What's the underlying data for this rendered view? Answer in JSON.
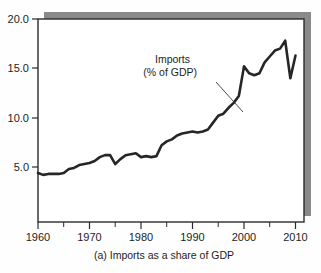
{
  "figure": {
    "caption": "(a) Imports as a share of GDP",
    "background_color": "#fefefe",
    "plot_background_color": "#ffffff",
    "frame_color": "#2b2b2b",
    "shadow_color": "#8a8a8a",
    "series_color": "#262626"
  },
  "annotation": {
    "line1": "Imports",
    "line2": "(% of GDP)",
    "leader_from_x": 216,
    "leader_from_y": 82,
    "leader_to_x": 243,
    "leader_to_y": 112
  },
  "axes": {
    "y_ticks": [
      "20.0",
      "15.0",
      "10.0",
      "5.0"
    ],
    "x_ticks": [
      "1960",
      "1970",
      "1980",
      "1990",
      "2000",
      "2010"
    ],
    "x_minor_ticks": [
      "1965",
      "1975",
      "1985",
      "1995",
      "2005"
    ]
  },
  "chart_data": {
    "type": "line",
    "title": "",
    "subtitle": "",
    "caption": "(a) Imports as a share of GDP",
    "xlabel": "",
    "ylabel": "",
    "ylim": [
      3.4,
      20.0
    ],
    "xlim": [
      1960,
      2012
    ],
    "grid": false,
    "legend": "annotation",
    "legend_position": "inside-upper-center",
    "y_tick_values": [
      5.0,
      10.0,
      15.0,
      20.0
    ],
    "x_tick_values": [
      1960,
      1970,
      1980,
      1990,
      2000,
      2010
    ],
    "x_minor_tick_values": [
      1965,
      1975,
      1985,
      1995,
      2005
    ],
    "series": [
      {
        "name": "Imports (% of GDP)",
        "color": "#262626",
        "x": [
          1960,
          1961,
          1962,
          1963,
          1964,
          1965,
          1966,
          1967,
          1968,
          1969,
          1970,
          1971,
          1972,
          1973,
          1974,
          1975,
          1976,
          1977,
          1978,
          1979,
          1980,
          1981,
          1982,
          1983,
          1984,
          1985,
          1986,
          1987,
          1988,
          1989,
          1990,
          1991,
          1992,
          1993,
          1994,
          1995,
          1996,
          1997,
          1998,
          1999,
          2000,
          2001,
          2002,
          2003,
          2004,
          2005,
          2006,
          2007,
          2008,
          2009,
          2010
        ],
        "values": [
          4.4,
          4.2,
          4.3,
          4.3,
          4.3,
          4.4,
          4.8,
          4.9,
          5.2,
          5.3,
          5.4,
          5.6,
          6.0,
          6.2,
          6.2,
          5.3,
          5.8,
          6.2,
          6.3,
          6.4,
          6.0,
          6.1,
          6.0,
          6.1,
          7.2,
          7.6,
          7.8,
          8.2,
          8.4,
          8.5,
          8.6,
          8.5,
          8.6,
          8.8,
          9.5,
          10.2,
          10.4,
          11.0,
          11.5,
          12.2,
          15.2,
          14.5,
          14.3,
          14.5,
          15.6,
          16.2,
          16.8,
          17.0,
          17.8,
          14.0,
          16.3
        ]
      }
    ]
  }
}
